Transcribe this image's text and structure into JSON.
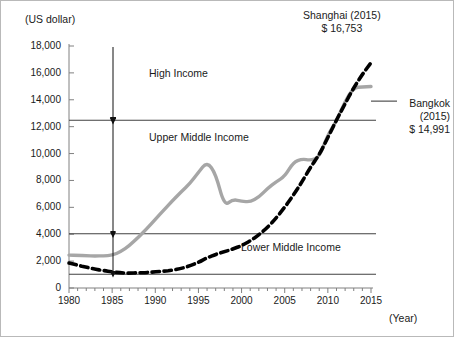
{
  "axis": {
    "unit_label": "(US dollar)",
    "year_label": "(Year)",
    "y_ticks": [
      "18,000",
      "16,000",
      "14,000",
      "12,000",
      "10,000",
      "8,000",
      "6,000",
      "4,000",
      "2,000",
      "0"
    ],
    "x_ticks": [
      "1980",
      "1985",
      "1990",
      "1995",
      "2000",
      "2005",
      "2010",
      "2015"
    ]
  },
  "bands": {
    "high": "High Income",
    "upper_middle": "Upper Middle Income",
    "lower_middle": "Lower Middle Income"
  },
  "callouts": {
    "shanghai": {
      "line1": "Shanghai (2015)",
      "line2": "$ 16,753"
    },
    "bangkok": {
      "line1": "Bangkok",
      "line2": "(2015)",
      "line3": "$ 14,991"
    }
  },
  "colors": {
    "bangkok_line": "#a6a6a6",
    "shanghai_line": "#000000",
    "threshold_line": "#404040",
    "axis": "#808080",
    "text": "#1a1a1a"
  },
  "chart_data": {
    "type": "line",
    "title": "",
    "xlabel": "(Year)",
    "ylabel": "(US dollar)",
    "xlim": [
      1980,
      2015
    ],
    "ylim": [
      0,
      18000
    ],
    "ytick_step": 2000,
    "grid": false,
    "legend": "annotations",
    "x": [
      1980,
      1981,
      1982,
      1983,
      1984,
      1985,
      1986,
      1987,
      1988,
      1989,
      1990,
      1991,
      1992,
      1993,
      1994,
      1995,
      1996,
      1997,
      1998,
      1999,
      2000,
      2001,
      2002,
      2003,
      2004,
      2005,
      2006,
      2007,
      2008,
      2009,
      2010,
      2011,
      2012,
      2013,
      2014,
      2015
    ],
    "series": [
      {
        "name": "Bangkok",
        "style": "solid-gray",
        "color": "#a6a6a6",
        "values": [
          2450,
          2430,
          2400,
          2380,
          2390,
          2430,
          2700,
          3150,
          3750,
          4400,
          5100,
          5800,
          6500,
          7150,
          7750,
          8600,
          9400,
          8500,
          6100,
          6600,
          6450,
          6400,
          6750,
          7400,
          7900,
          8300,
          9350,
          9600,
          9500,
          9700,
          11400,
          12400,
          13900,
          14900,
          14950,
          14991
        ]
      },
      {
        "name": "Shanghai",
        "style": "dashed-black",
        "color": "#000000",
        "values": [
          1850,
          1700,
          1550,
          1400,
          1300,
          1200,
          1120,
          1100,
          1130,
          1150,
          1200,
          1250,
          1330,
          1450,
          1650,
          1900,
          2250,
          2500,
          2700,
          2900,
          3150,
          3500,
          3950,
          4500,
          5200,
          6000,
          6900,
          7900,
          9000,
          9900,
          11200,
          12500,
          13700,
          14900,
          15900,
          16753
        ]
      }
    ],
    "threshold_lines": [
      {
        "label": "High Income",
        "value": 12476,
        "boundary_label": "Upper Middle Income"
      },
      {
        "label": "Upper Middle Income",
        "value": 4036
      },
      {
        "label": "Lower Middle Income",
        "value": 1026
      }
    ]
  }
}
